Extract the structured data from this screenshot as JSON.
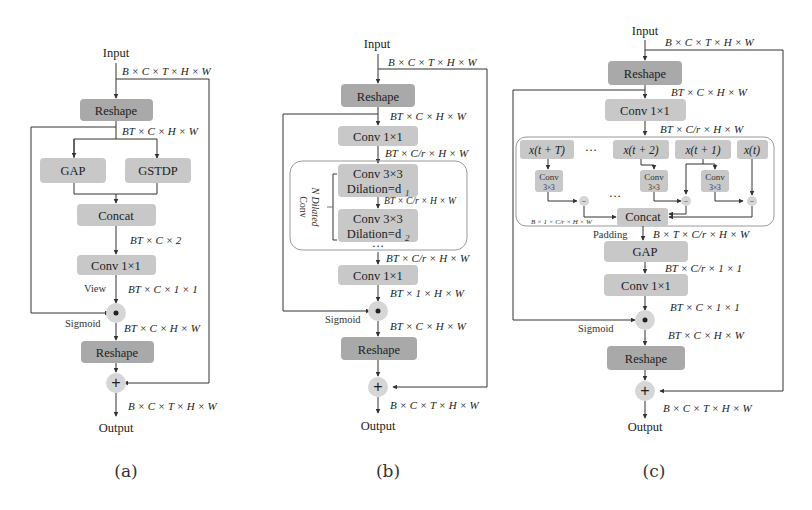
{
  "panels": {
    "a": {
      "caption": "(a)",
      "input": "Input",
      "output": "Output",
      "dims": {
        "in": "B × C × T × H × W",
        "after_reshape": "BT × C × H × W",
        "after_concat": "BT × C × 2",
        "after_conv": "BT × C × 1 × 1",
        "after_mul": "BT × C × H × W",
        "out": "B × C × T × H × W"
      },
      "blocks": {
        "reshape1": "Reshape",
        "gap": "GAP",
        "gstdp": "GSTDP",
        "concat": "Concat",
        "conv": "Conv 1×1",
        "reshape2": "Reshape"
      },
      "labels": {
        "view": "View",
        "sigmoid": "Sigmoid"
      },
      "ops": {
        "mul": "•",
        "add": "+"
      }
    },
    "b": {
      "caption": "(b)",
      "input": "Input",
      "output": "Output",
      "dims": {
        "in": "B × C × T × H × W",
        "after_reshape": "BT × C × H × W",
        "after_conv1": "BT × C/r × H × W",
        "after_dil1": "BT × C/r × H × W",
        "after_dil_group": "BT × C/r × H × W",
        "after_conv2": "BT × 1 × H × W",
        "after_mul": "BT × C × H × W",
        "out": "B × C × T × H × W"
      },
      "blocks": {
        "reshape1": "Reshape",
        "conv1": "Conv 1×1",
        "dil1_line1": "Conv 3×3",
        "dil1_line2": "Dilation=d",
        "dil1_sub": "1",
        "dil2_line1": "Conv 3×3",
        "dil2_line2": "Dilation=d",
        "dil2_sub": "2",
        "ellipsis": "···",
        "conv2": "Conv 1×1",
        "reshape2": "Reshape"
      },
      "labels": {
        "group_line1": "N Dilated",
        "group_line2": "Conv",
        "sigmoid": "Sigmoid"
      },
      "ops": {
        "mul": "•",
        "add": "+"
      }
    },
    "c": {
      "caption": "(c)",
      "input": "Input",
      "output": "Output",
      "dims": {
        "in": "B × C × T × H × W",
        "after_reshape": "BT × C × H × W",
        "after_conv1": "BT × C/r × H × W",
        "diff": "B × 1 × C/r × H × W",
        "after_padding": "B × T × C/r × H × W",
        "after_gap": "BT × C/r × 1 × 1",
        "after_conv2": "BT × C × 1 × 1",
        "after_mul": "BT × C × H × W",
        "out": "B × C × T × H × W"
      },
      "blocks": {
        "reshape1": "Reshape",
        "conv1": "Conv 1×1",
        "frames": [
          "x(t + T)",
          "x(t + 2)",
          "x(t + 1)",
          "x(t)"
        ],
        "frame_ellipsis": "···",
        "small_conv_line1": "Conv",
        "small_conv_line2": "3×3",
        "concat": "Concat",
        "concat_ellipsis": "···",
        "gap": "GAP",
        "conv2": "Conv 1×1",
        "reshape2": "Reshape"
      },
      "labels": {
        "padding": "Padding",
        "sigmoid": "Sigmoid"
      },
      "ops": {
        "sub": "−",
        "mul": "•",
        "add": "+"
      }
    }
  }
}
